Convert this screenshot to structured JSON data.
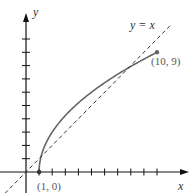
{
  "chart_data": {
    "type": "line",
    "title": "",
    "xlabel": "x",
    "ylabel": "y",
    "x_ticks": [
      1,
      2,
      3,
      4,
      5,
      6,
      7,
      8,
      9,
      10
    ],
    "y_ticks": [
      1,
      2,
      3,
      4,
      5,
      6,
      7,
      8,
      9,
      10
    ],
    "xlim": [
      -2,
      12
    ],
    "ylim": [
      -1.5,
      12
    ],
    "grid": false,
    "series": [
      {
        "name": "curve",
        "style": "solid",
        "color": "#666666",
        "function": "y = 3*sqrt(x-1)",
        "x": [
          1,
          1.25,
          1.5,
          2,
          3,
          4,
          5,
          6,
          7,
          8,
          9,
          10
        ],
        "values": [
          0,
          1.5,
          2.12,
          3,
          4.24,
          5.2,
          6,
          6.71,
          7.35,
          7.94,
          8.49,
          9
        ]
      },
      {
        "name": "y = x",
        "style": "dashed",
        "color": "#333333",
        "x": [
          -1.6,
          11
        ],
        "values": [
          -1.6,
          11
        ]
      }
    ],
    "points": [
      {
        "label": "(1, 0)",
        "x": 1,
        "y": 0
      },
      {
        "label": "(10, 9)",
        "x": 10,
        "y": 9
      }
    ],
    "annotations": [
      {
        "text": "y = x",
        "near": [
          10,
          11
        ]
      }
    ]
  },
  "labels": {
    "x_axis": "x",
    "y_axis": "y",
    "line_label": "y = x",
    "point_start": "(1, 0)",
    "point_end": "(10, 9)"
  }
}
